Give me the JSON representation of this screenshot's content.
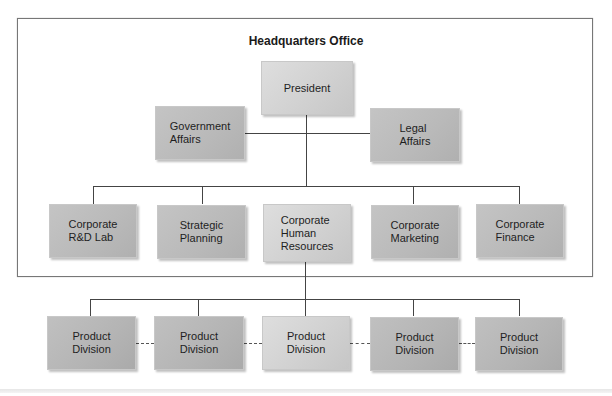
{
  "diagram": {
    "hq_title": "Headquarters Office",
    "president": {
      "label": "President"
    },
    "staff": [
      {
        "label": "Government\nAffairs"
      },
      {
        "label": "Legal\nAffairs"
      }
    ],
    "corporate_units": [
      {
        "label": "Corporate\nR&D Lab"
      },
      {
        "label": "Strategic\nPlanning"
      },
      {
        "label": "Corporate\nHuman\nResources"
      },
      {
        "label": "Corporate\nMarketing"
      },
      {
        "label": "Corporate\nFinance"
      }
    ],
    "divisions": [
      {
        "label": "Product\nDivision"
      },
      {
        "label": "Product\nDivision"
      },
      {
        "label": "Product\nDivision"
      },
      {
        "label": "Product\nDivision"
      },
      {
        "label": "Product\nDivision"
      }
    ],
    "colors": {
      "line": "#444444",
      "frame": "#777777",
      "box_light": "#d2d2d2",
      "box_mid": "#b9b9b9",
      "text": "#1e1e1e"
    }
  }
}
